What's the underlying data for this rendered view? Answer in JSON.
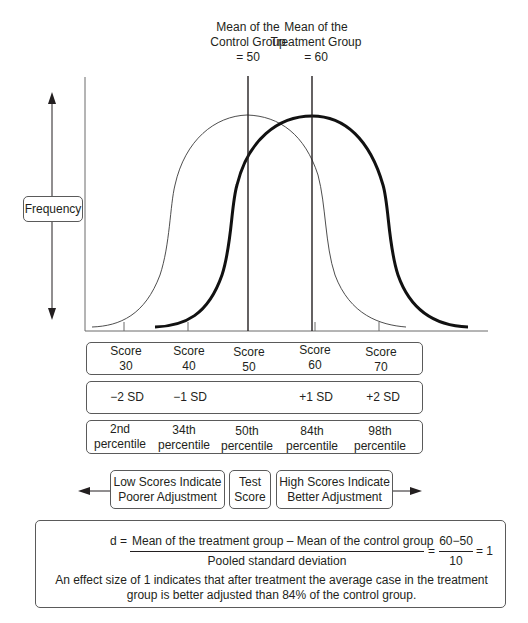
{
  "header_labels": {
    "control_mean": {
      "line1": "Mean of the",
      "line2": "Control Group",
      "line3": "= 50"
    },
    "treatment_mean": {
      "line1": "Mean of the",
      "line2": "Treatment Group",
      "line3": "= 60"
    }
  },
  "y_axis": {
    "label": "Frequency"
  },
  "curves": [
    {
      "name": "Control group",
      "mean": 50,
      "sd": 10,
      "stroke": "thin"
    },
    {
      "name": "Treatment group",
      "mean": 60,
      "sd": 10,
      "stroke": "thick"
    }
  ],
  "score_row": [
    {
      "line1": "Score",
      "line2": "30"
    },
    {
      "line1": "Score",
      "line2": "40"
    },
    {
      "line1": "Score",
      "line2": "50"
    },
    {
      "line1": "Score",
      "line2": "60"
    },
    {
      "line1": "Score",
      "line2": "70"
    }
  ],
  "sd_row": [
    "−2 SD",
    "−1 SD",
    "",
    "+1 SD",
    "+2 SD"
  ],
  "percentile_row": [
    {
      "line1": "2nd",
      "line2": "percentile"
    },
    {
      "line1": "34th",
      "line2": "percentile"
    },
    {
      "line1": "50th",
      "line2": "percentile"
    },
    {
      "line1": "84th",
      "line2": "percentile"
    },
    {
      "line1": "98th",
      "line2": "percentile"
    }
  ],
  "scale": {
    "low": {
      "line1": "Low Scores Indicate",
      "line2": "Poorer Adjustment"
    },
    "middle": {
      "line1": "Test",
      "line2": "Score"
    },
    "high": {
      "line1": "High Scores Indicate",
      "line2": "Better Adjustment"
    }
  },
  "formula": {
    "lhs": "d =",
    "numerator": "Mean of the treatment group – Mean of the control group",
    "denominator": "Pooled standard deviation",
    "eq1": "=",
    "num2": "60−50",
    "den2": "10",
    "eq2": "= 1",
    "explanation_line1": "An effect size of 1 indicates that after treatment the average case in the treatment",
    "explanation_line2": "group is better adjusted than 84% of the control group."
  },
  "colors": {
    "ink": "#231f20",
    "border": "#5a5a5a",
    "background": "#ffffff"
  }
}
